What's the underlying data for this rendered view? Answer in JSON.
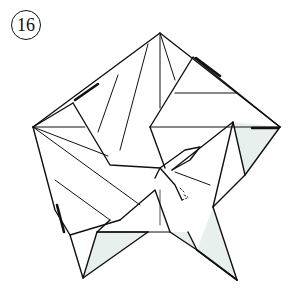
{
  "step": {
    "number": "16"
  },
  "colors": {
    "line": "#111111",
    "fill_back": "#e8f0ee",
    "fill_front": "#ffffff",
    "crease": "#333333"
  },
  "diagram": {
    "vertices": {
      "top": [
        160,
        33
      ],
      "left": [
        33,
        127
      ],
      "right": [
        280,
        127
      ],
      "bottom_left": [
        83,
        278
      ],
      "bottom_right": [
        237,
        280
      ],
      "center": [
        160,
        168
      ]
    }
  }
}
